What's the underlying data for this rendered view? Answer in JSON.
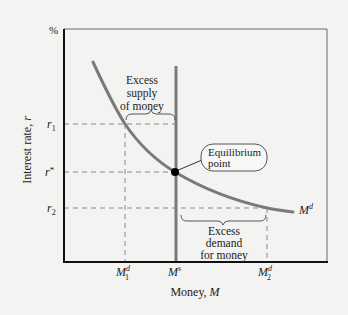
{
  "diagram": {
    "type": "money-market-equilibrium",
    "y_axis": {
      "unit_label": "%",
      "title": "Interest rate, ",
      "title_var": "r"
    },
    "x_axis": {
      "title": "Money, ",
      "title_var": "M"
    },
    "y_ticks": [
      {
        "id": "r1",
        "base": "r",
        "sub": "1",
        "sup": ""
      },
      {
        "id": "rstar",
        "base": "r",
        "sub": "",
        "sup": "*"
      },
      {
        "id": "r2",
        "base": "r",
        "sub": "2",
        "sup": ""
      }
    ],
    "x_ticks": [
      {
        "id": "M1d",
        "base": "M",
        "sub": "1",
        "sup": "d"
      },
      {
        "id": "Ms",
        "base": "M",
        "sub": "",
        "sup": "s"
      },
      {
        "id": "M2d",
        "base": "M",
        "sub": "2",
        "sup": "d"
      }
    ],
    "curves": {
      "demand": {
        "base": "M",
        "sup": "d"
      },
      "supply": {
        "base": "M",
        "sup": "s"
      }
    },
    "annotations": {
      "excess_supply": [
        "Excess",
        "supply",
        "of money"
      ],
      "excess_demand": [
        "Excess",
        "demand",
        "for money"
      ],
      "equilibrium": [
        "Equilibrium",
        "point"
      ]
    },
    "colors": {
      "background": "#f3f3f1",
      "axis": "#111111",
      "curve": "#7a7a7a",
      "dashed": "#8a8a8a",
      "frame": "#6a6a6a",
      "point": "#000000"
    }
  }
}
